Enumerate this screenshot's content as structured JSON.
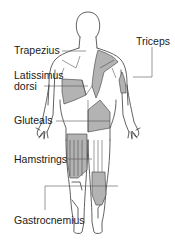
{
  "colors": {
    "outline": "#3a3a3a",
    "highlight": "#b3b3b3",
    "leader": "#555555",
    "text": "#1a1a1a",
    "background": "#ffffff"
  },
  "labels": {
    "trapezius": "Trapezius",
    "triceps": "Triceps",
    "latissimus_line1": "Latissimus",
    "latissimus_line2": "dorsi",
    "gluteals": "Gluteals",
    "hamstrings": "Hamstrings",
    "gastrocnemius": "Gastrocnemius"
  }
}
